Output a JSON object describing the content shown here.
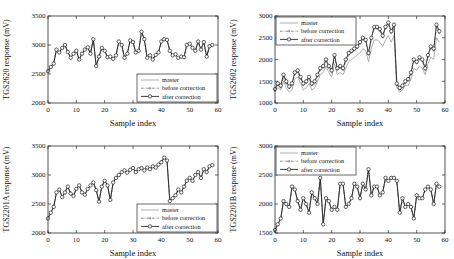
{
  "figure": {
    "background": "#ffffff",
    "colors": {
      "master": "#a6a6a6",
      "before": "#6e6e6e",
      "after": "#1c1c1c",
      "axis": "#2a2a2a",
      "text": "#111111"
    },
    "legend_labels": [
      "master",
      "before correction",
      "after correction"
    ]
  },
  "chart_data": [
    {
      "type": "line",
      "id": "tgs2620",
      "ylabel": "TGS2620 response (mV)",
      "xlabel": "Sample index",
      "xlim": [
        0,
        60
      ],
      "xticks": [
        0,
        10,
        20,
        30,
        40,
        50,
        60
      ],
      "ylim": [
        2000,
        3500
      ],
      "yticks": [
        2000,
        2500,
        3000,
        3500
      ],
      "grid": false,
      "legend_position": "bottom-right",
      "series": [
        {
          "name": "master",
          "values": [
            2550,
            2620,
            2680,
            2920,
            2870,
            2950,
            3000,
            2880,
            2780,
            2850,
            2900,
            2750,
            2850,
            2920,
            2960,
            2850,
            3100,
            2640,
            2800,
            2950,
            2900,
            2790,
            2800,
            2760,
            2820,
            3060,
            3000,
            2780,
            2850,
            3080,
            3050,
            2870,
            2900,
            3230,
            3100,
            2780,
            2820,
            2750,
            2830,
            2870,
            3060,
            3100,
            3090,
            2900,
            2820,
            2840,
            2780,
            2800,
            2790,
            3000,
            3020,
            2950,
            2900,
            3060,
            2920,
            3050,
            2800,
            2980,
            3000
          ]
        },
        {
          "name": "before correction",
          "values": [
            2550,
            2620,
            2680,
            2920,
            2870,
            2950,
            3000,
            2880,
            2780,
            2850,
            2900,
            2750,
            2850,
            2920,
            2960,
            2850,
            3100,
            2640,
            2800,
            2950,
            2900,
            2790,
            2800,
            2760,
            2820,
            3060,
            3000,
            2780,
            2850,
            3080,
            3050,
            2870,
            2900,
            3230,
            3100,
            2780,
            2820,
            2750,
            2830,
            2870,
            3060,
            3100,
            3090,
            2900,
            2820,
            2840,
            2780,
            2800,
            2790,
            3000,
            3020,
            2950,
            2900,
            3060,
            2920,
            3050,
            2800,
            2980,
            3000
          ]
        },
        {
          "name": "after correction",
          "values": [
            2550,
            2620,
            2680,
            2920,
            2870,
            2950,
            3000,
            2880,
            2780,
            2850,
            2900,
            2750,
            2850,
            2920,
            2960,
            2850,
            3100,
            2640,
            2800,
            2950,
            2900,
            2790,
            2800,
            2760,
            2820,
            3060,
            3000,
            2780,
            2850,
            3080,
            3050,
            2870,
            2900,
            3230,
            3100,
            2780,
            2820,
            2750,
            2830,
            2870,
            3060,
            3100,
            3090,
            2900,
            2820,
            2840,
            2780,
            2800,
            2790,
            3000,
            3020,
            2950,
            2900,
            3060,
            2920,
            3050,
            2800,
            2980,
            3000
          ]
        }
      ]
    },
    {
      "type": "line",
      "id": "tgs2602",
      "ylabel": "TGS2602 response (mV)",
      "xlabel": "Sample index",
      "xlim": [
        0,
        60
      ],
      "xticks": [
        0,
        10,
        20,
        30,
        40,
        50,
        60
      ],
      "ylim": [
        1000,
        3000
      ],
      "yticks": [
        1000,
        1500,
        2000,
        2500,
        3000
      ],
      "grid": false,
      "legend_position": "top-left",
      "series": [
        {
          "name": "master",
          "values": [
            1300,
            1350,
            1300,
            1500,
            1350,
            1250,
            1300,
            1550,
            1600,
            1450,
            1300,
            1350,
            1450,
            1300,
            1350,
            1500,
            1650,
            1700,
            1850,
            1700,
            1600,
            1900,
            1650,
            1700,
            1650,
            1800,
            1950,
            2000,
            2050,
            2100,
            2150,
            2250,
            2200,
            1950,
            2250,
            2450,
            2450,
            2400,
            2300,
            2450,
            2550,
            2400,
            2550,
            1350,
            1250,
            1300,
            1400,
            1400,
            1550,
            1800,
            1750,
            1850,
            1800,
            1650,
            1900,
            2050,
            2000,
            2500,
            2400
          ]
        },
        {
          "name": "before correction",
          "values": [
            1280,
            1410,
            1360,
            1610,
            1460,
            1340,
            1410,
            1660,
            1710,
            1560,
            1410,
            1460,
            1560,
            1410,
            1460,
            1610,
            1760,
            1810,
            1960,
            1810,
            1710,
            2060,
            1760,
            1810,
            1760,
            1960,
            2110,
            2160,
            2210,
            2260,
            2360,
            2460,
            2410,
            2110,
            2460,
            2710,
            2710,
            2660,
            2510,
            2710,
            2810,
            2610,
            2760,
            1410,
            1310,
            1360,
            1460,
            1510,
            1660,
            1960,
            1910,
            2010,
            1960,
            1760,
            2060,
            2260,
            2210,
            2760,
            2610
          ]
        },
        {
          "name": "after correction",
          "values": [
            1320,
            1450,
            1400,
            1650,
            1500,
            1380,
            1450,
            1700,
            1750,
            1600,
            1450,
            1500,
            1600,
            1450,
            1500,
            1650,
            1800,
            1850,
            2000,
            1850,
            1750,
            2100,
            1800,
            1850,
            1800,
            2000,
            2150,
            2200,
            2250,
            2300,
            2400,
            2500,
            2450,
            2150,
            2500,
            2750,
            2750,
            2700,
            2550,
            2750,
            2850,
            2650,
            2800,
            1450,
            1350,
            1400,
            1500,
            1550,
            1700,
            2000,
            1950,
            2050,
            2000,
            1800,
            2100,
            2300,
            2250,
            2800,
            2650
          ]
        }
      ]
    },
    {
      "type": "line",
      "id": "tgs2201a",
      "ylabel": "TGS2201A response (mV)",
      "xlabel": "Sample index",
      "xlim": [
        0,
        60
      ],
      "xticks": [
        0,
        10,
        20,
        30,
        40,
        50,
        60
      ],
      "ylim": [
        2000,
        3500
      ],
      "yticks": [
        2000,
        2500,
        3000,
        3500
      ],
      "grid": false,
      "legend_position": "bottom-right",
      "series": [
        {
          "name": "master",
          "values": [
            2250,
            2350,
            2450,
            2700,
            2750,
            2620,
            2700,
            2800,
            2680,
            2640,
            2760,
            2820,
            2700,
            2660,
            2760,
            2820,
            2870,
            2740,
            2540,
            2800,
            2900,
            2820,
            2570,
            2870,
            2950,
            3000,
            3050,
            3080,
            3040,
            3090,
            3120,
            3050,
            3100,
            3120,
            3080,
            3130,
            3100,
            3150,
            3130,
            3180,
            3220,
            3300,
            3250,
            2550,
            2600,
            2650,
            2750,
            2700,
            2800,
            2900,
            2950,
            2900,
            3000,
            3050,
            2950,
            3100,
            3050,
            3150,
            3170
          ]
        },
        {
          "name": "before correction",
          "values": [
            2250,
            2350,
            2450,
            2700,
            2750,
            2620,
            2700,
            2800,
            2680,
            2640,
            2760,
            2820,
            2700,
            2660,
            2760,
            2820,
            2870,
            2740,
            2540,
            2800,
            2900,
            2820,
            2570,
            2870,
            2950,
            3000,
            3050,
            3080,
            3040,
            3090,
            3120,
            3050,
            3100,
            3120,
            3080,
            3130,
            3100,
            3150,
            3130,
            3180,
            3220,
            3300,
            3250,
            2550,
            2600,
            2650,
            2750,
            2700,
            2800,
            2900,
            2950,
            2900,
            3000,
            3050,
            2950,
            3100,
            3050,
            3150,
            3170
          ]
        },
        {
          "name": "after correction",
          "values": [
            2250,
            2350,
            2450,
            2700,
            2750,
            2620,
            2700,
            2800,
            2680,
            2640,
            2760,
            2820,
            2700,
            2660,
            2760,
            2820,
            2870,
            2740,
            2540,
            2800,
            2900,
            2820,
            2570,
            2870,
            2950,
            3000,
            3050,
            3080,
            3040,
            3090,
            3120,
            3050,
            3100,
            3120,
            3080,
            3130,
            3100,
            3150,
            3130,
            3180,
            3220,
            3300,
            3250,
            2550,
            2600,
            2650,
            2750,
            2700,
            2800,
            2900,
            2950,
            2900,
            3000,
            3050,
            2950,
            3100,
            3050,
            3150,
            3170
          ]
        }
      ]
    },
    {
      "type": "line",
      "id": "tgs2201b",
      "ylabel": "TGS2201B response (mV)",
      "xlabel": "Sample index",
      "xlim": [
        0,
        60
      ],
      "xticks": [
        0,
        10,
        20,
        30,
        40,
        50,
        60
      ],
      "ylim": [
        1500,
        3000
      ],
      "yticks": [
        1500,
        2000,
        2500,
        3000
      ],
      "grid": false,
      "legend_position": "top-left",
      "series": [
        {
          "name": "master",
          "values": [
            1550,
            1650,
            1750,
            2050,
            2000,
            1950,
            2300,
            2250,
            2050,
            1900,
            2100,
            2000,
            1850,
            2200,
            2100,
            2000,
            2450,
            1650,
            2100,
            2050,
            1900,
            1950,
            1900,
            2350,
            2350,
            1950,
            2000,
            2100,
            2350,
            2300,
            2100,
            2350,
            2250,
            2600,
            2150,
            2300,
            2300,
            2150,
            2200,
            2450,
            2400,
            2450,
            2450,
            2400,
            1850,
            2100,
            1950,
            2000,
            1950,
            1750,
            2150,
            2100,
            2100,
            2250,
            2300,
            2250,
            2000,
            2350,
            2300
          ]
        },
        {
          "name": "before correction",
          "values": [
            1550,
            1650,
            1750,
            2050,
            2000,
            1950,
            2300,
            2250,
            2050,
            1900,
            2100,
            2000,
            1850,
            2200,
            2100,
            2000,
            2450,
            1650,
            2100,
            2050,
            1900,
            1950,
            1900,
            2350,
            2350,
            1950,
            2000,
            2100,
            2350,
            2300,
            2100,
            2350,
            2250,
            2600,
            2150,
            2300,
            2300,
            2150,
            2200,
            2450,
            2400,
            2450,
            2450,
            2400,
            1850,
            2100,
            1950,
            2000,
            1950,
            1750,
            2150,
            2100,
            2100,
            2250,
            2300,
            2250,
            2000,
            2350,
            2300
          ]
        },
        {
          "name": "after correction",
          "values": [
            1550,
            1650,
            1750,
            2050,
            2000,
            1950,
            2300,
            2250,
            2050,
            1900,
            2100,
            2000,
            1850,
            2200,
            2100,
            2000,
            2450,
            1650,
            2100,
            2050,
            1900,
            1950,
            1900,
            2350,
            2350,
            1950,
            2000,
            2100,
            2350,
            2300,
            2100,
            2350,
            2250,
            2600,
            2150,
            2300,
            2300,
            2150,
            2200,
            2450,
            2400,
            2450,
            2450,
            2400,
            1850,
            2100,
            1950,
            2000,
            1950,
            1750,
            2150,
            2100,
            2100,
            2250,
            2300,
            2250,
            2000,
            2350,
            2300
          ]
        }
      ]
    }
  ]
}
